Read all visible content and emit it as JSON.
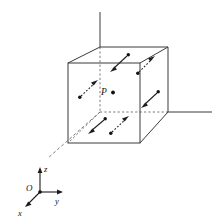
{
  "figure": {
    "type": "geometry-diagram",
    "background_color": "#ffffff",
    "line_color": "#3a3a3a",
    "hidden_line_color": "#6b6b6b",
    "arrow_color": "#1d1d1d"
  },
  "labels": {
    "point_p": "P",
    "axis_x": "x",
    "axis_y": "y",
    "axis_z": "z",
    "origin": "O"
  },
  "cube": {
    "description": "Wireframe cube drawn in oblique projection; hidden back edges dashed",
    "front_face": {
      "top_left": [
        68,
        63
      ],
      "top_right": [
        140,
        63
      ],
      "bottom_right": [
        140,
        143
      ],
      "bottom_left": [
        68,
        143
      ]
    },
    "back_face": {
      "top_left": [
        100,
        47
      ],
      "top_right": [
        168,
        47
      ],
      "bottom_right": [
        168,
        112
      ],
      "bottom_left": [
        100,
        112
      ]
    },
    "hidden_edges": [
      "back-left-vertical",
      "back-bottom-left-to-front-bottom-left",
      "back-bottom-left-to-back-bottom-right"
    ]
  },
  "point": {
    "label": "P",
    "position": [
      113,
      91
    ],
    "label_position": [
      103,
      92
    ]
  },
  "arrows": [
    {
      "id": "arrow-top-left-inward",
      "shaft_style": "solid",
      "tail": [
        128,
        55
      ],
      "tip": [
        110,
        72
      ],
      "tail_dot": true,
      "face": "top",
      "direction": "down-left"
    },
    {
      "id": "arrow-top-right-outward",
      "shaft_style": "dashed",
      "tail": [
        138,
        73
      ],
      "tip": [
        155,
        56
      ],
      "tail_dot": true,
      "face": "top",
      "direction": "up-right"
    },
    {
      "id": "arrow-left-upward",
      "shaft_style": "dashed",
      "tail": [
        80,
        97
      ],
      "tip": [
        98,
        80
      ],
      "tail_dot": true,
      "face": "left",
      "direction": "up-right"
    },
    {
      "id": "arrow-right-inward",
      "shaft_style": "solid",
      "tail": [
        158,
        92
      ],
      "tip": [
        141,
        108
      ],
      "tail_dot": true,
      "face": "right",
      "direction": "down-left"
    },
    {
      "id": "arrow-bottom-left-outward",
      "shaft_style": "solid",
      "tail": [
        105,
        119
      ],
      "tip": [
        88,
        134
      ],
      "tail_dot": true,
      "face": "bottom",
      "direction": "down-left"
    },
    {
      "id": "arrow-bottom-right-inward",
      "shaft_style": "dashed",
      "tail": [
        111,
        133
      ],
      "tip": [
        129,
        116
      ],
      "tail_dot": true,
      "face": "bottom",
      "direction": "up-right"
    }
  ],
  "axes_through_cube": [
    {
      "id": "vertical-axis",
      "style": "solid",
      "from": [
        100,
        47
      ],
      "to": [
        100,
        12
      ]
    },
    {
      "id": "horizontal-axis",
      "style": "solid",
      "from": [
        168,
        112
      ],
      "to": [
        212,
        112
      ]
    },
    {
      "id": "oblique-axis",
      "style": "dashed",
      "from": [
        100,
        112
      ],
      "to": [
        48,
        158
      ]
    }
  ],
  "triad": {
    "origin": [
      40,
      192
    ],
    "z_tip": [
      40,
      168
    ],
    "y_tip": [
      62,
      192
    ],
    "x_tip": [
      25,
      208
    ],
    "label_z_position": [
      45,
      170
    ],
    "label_y_position": [
      57,
      203
    ],
    "label_x_position": [
      20,
      215
    ],
    "label_o_position": [
      26,
      190
    ]
  }
}
